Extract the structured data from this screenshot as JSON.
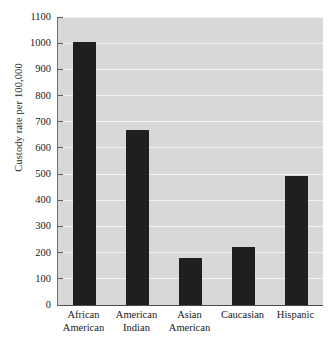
{
  "chart_data": {
    "type": "bar",
    "title": "",
    "subtitle": "",
    "xlabel": "",
    "ylabel": "Custody rate per 100,000",
    "ylim": [
      0,
      1100
    ],
    "ytick_step": 100,
    "grid": "horizontal",
    "legend": "none",
    "categories": [
      "African American",
      "American Indian",
      "Asian American",
      "Caucasian",
      "Hispanic"
    ],
    "category_lines": [
      [
        "African",
        "American"
      ],
      [
        "American",
        "Indian"
      ],
      [
        "Asian",
        "American"
      ],
      [
        "Caucasian",
        ""
      ],
      [
        "Hispanic",
        ""
      ]
    ],
    "values": [
      1005,
      670,
      180,
      222,
      492
    ],
    "yticks": [
      0,
      100,
      200,
      300,
      400,
      500,
      600,
      700,
      800,
      900,
      1000,
      1100
    ],
    "ytick_labels": [
      "0",
      "100",
      "200",
      "300",
      "400",
      "500",
      "600",
      "700",
      "800",
      "900",
      "1000",
      "1100"
    ],
    "colors": {
      "bar": "#1f1f1f",
      "plot_background": "#d8d8d8",
      "gridline": "#f2f2f2",
      "axis": "#4a4a4a",
      "page_background": "#ffffff",
      "text": "#1a1a1a"
    }
  }
}
